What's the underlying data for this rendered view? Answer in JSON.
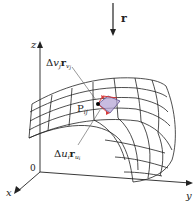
{
  "figure": {
    "type": "parametric-surface-patch",
    "arrow_label": "r",
    "axes": {
      "x_label": "x",
      "y_label": "y",
      "z_label": "z",
      "origin_label": "0"
    },
    "point_label": "P",
    "point_subscript": "ij",
    "vector_v_label": {
      "delta": "Δ",
      "var": "v",
      "var_sub": "j",
      "vec": "r",
      "vec_sub": "v",
      "vec_subsub": "j"
    },
    "vector_u_label": {
      "delta": "Δ",
      "var": "u",
      "var_sub": "i",
      "vec": "r",
      "vec_sub": "u",
      "vec_subsub": "i"
    },
    "colors": {
      "patch_fill": "#b6a6d6",
      "patch_outline": "#d63a3a",
      "grid": "#222222",
      "point": "#000000"
    }
  }
}
